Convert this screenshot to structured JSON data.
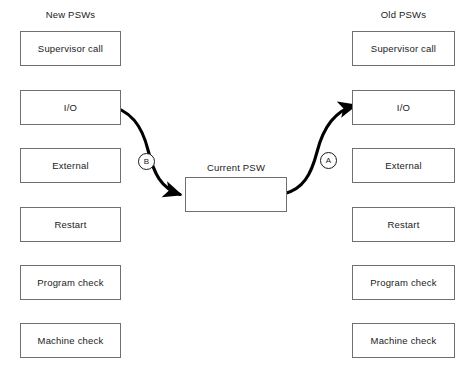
{
  "diagram": {
    "columns": {
      "new": {
        "heading": "New PSWs",
        "boxes": [
          {
            "label": "Supervisor call"
          },
          {
            "label": "I/O"
          },
          {
            "label": "External"
          },
          {
            "label": "Restart"
          },
          {
            "label": "Program check"
          },
          {
            "label": "Machine check"
          }
        ]
      },
      "old": {
        "heading": "Old PSWs",
        "boxes": [
          {
            "label": "Supervisor call"
          },
          {
            "label": "I/O"
          },
          {
            "label": "External"
          },
          {
            "label": "Restart"
          },
          {
            "label": "Program check"
          },
          {
            "label": "Machine check"
          }
        ]
      }
    },
    "center": {
      "label": "Current PSW"
    },
    "flows": [
      {
        "id": "A",
        "marker_label": "A",
        "from": "Current PSW",
        "to": "Old PSWs I/O",
        "source_endpoint": "dot",
        "target_endpoint": "arrow"
      },
      {
        "id": "B",
        "marker_label": "B",
        "from": "New PSWs I/O",
        "to": "Current PSW",
        "source_endpoint": "dot",
        "target_endpoint": "arrow"
      }
    ],
    "colors": {
      "background": "#ffffff",
      "box_border": "#6f6f6f",
      "text": "#1a1a1a",
      "flow_line": "#000000"
    }
  }
}
